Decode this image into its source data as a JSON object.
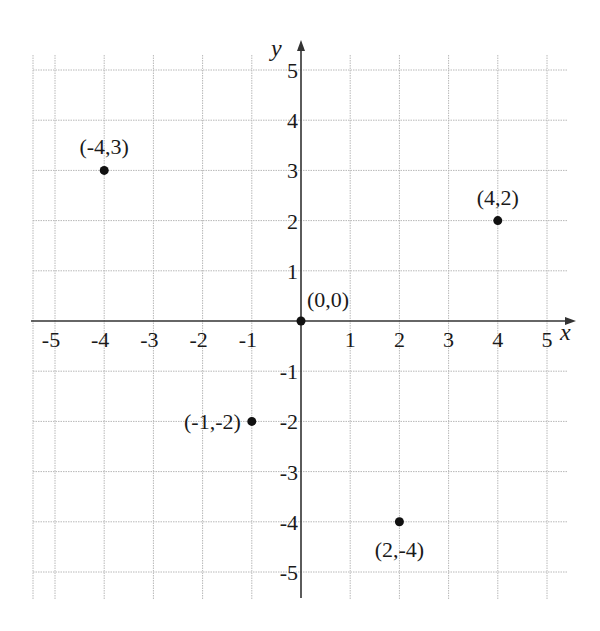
{
  "chart_data": {
    "type": "scatter",
    "title": "",
    "xlabel": "x",
    "ylabel": "y",
    "xlim": [
      -5,
      5
    ],
    "ylim": [
      -5,
      5
    ],
    "grid": true,
    "legend": null,
    "x_ticks": [
      "-5",
      "-4",
      "-3",
      "-2",
      "-1",
      "1",
      "2",
      "3",
      "4",
      "5"
    ],
    "y_ticks": [
      "5",
      "4",
      "3",
      "2",
      "1",
      "-1",
      "-2",
      "-3",
      "-4",
      "-5"
    ],
    "points": [
      {
        "x": -4,
        "y": 3,
        "label": "(-4,3)",
        "label_pos": "above"
      },
      {
        "x": 4,
        "y": 2,
        "label": "(4,2)",
        "label_pos": "above"
      },
      {
        "x": 0,
        "y": 0,
        "label": "(0,0)",
        "label_pos": "above-right"
      },
      {
        "x": -1,
        "y": -2,
        "label": "(-1,-2)",
        "label_pos": "left"
      },
      {
        "x": 2,
        "y": -4,
        "label": "(2,-4)",
        "label_pos": "below"
      }
    ],
    "colors": {
      "axis": "#333333",
      "grid": "#b8b8b8",
      "point": "#111111",
      "text": "#1a1a1a"
    }
  }
}
